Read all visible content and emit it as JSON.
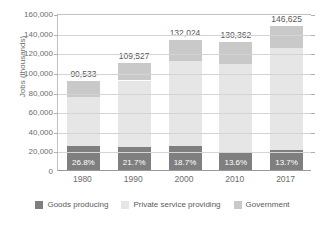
{
  "chart_data": {
    "type": "bar",
    "subtype": "stacked-bar",
    "title": "",
    "xlabel": "",
    "ylabel": "Jobs (thousands)",
    "ylim": [
      0,
      160000
    ],
    "ytick_step": 20000,
    "ytick_labels": [
      "160,000",
      "140,000",
      "120,000",
      "100,000",
      "80,000",
      "60,000",
      "40,000",
      "20,000",
      "0"
    ],
    "ytick_values": [
      160000,
      140000,
      120000,
      100000,
      80000,
      60000,
      40000,
      20000,
      0
    ],
    "grid": true,
    "legend_position": "bottom",
    "categories": [
      "1980",
      "1990",
      "2000",
      "2010",
      "2017"
    ],
    "totals": [
      90533,
      109527,
      132024,
      130362,
      146625
    ],
    "total_labels": [
      "90,533",
      "109,527",
      "132,024",
      "130,362",
      "146,625"
    ],
    "goods_pct_labels": [
      "26.8%",
      "21.7%",
      "18.7%",
      "13.6%",
      "13.7%"
    ],
    "series": [
      {
        "name": "Goods producing",
        "color": "#7f7f7f",
        "values": [
          24263,
          23767,
          24689,
          17729,
          20088
        ]
      },
      {
        "name": "Private service providing",
        "color": "#e6e6e6",
        "values": [
          49870,
          67460,
          86535,
          90133,
          104237
        ]
      },
      {
        "name": "Government",
        "color": "#c9c9c9",
        "values": [
          16400,
          18300,
          20800,
          22500,
          22300
        ]
      }
    ]
  },
  "legend": {
    "items": [
      {
        "label": "Goods producing",
        "color": "#7f7f7f"
      },
      {
        "label": "Private service providing",
        "color": "#e6e6e6"
      },
      {
        "label": "Government",
        "color": "#c9c9c9"
      }
    ]
  }
}
